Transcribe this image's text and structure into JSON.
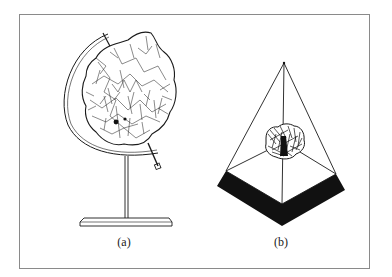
{
  "figure": {
    "panels": [
      {
        "id": "a",
        "caption": "(a)",
        "subject": "crumpled globe on a stand"
      },
      {
        "id": "b",
        "caption": "(b)",
        "subject": "crumpled object inside a wireframe pyramid with black base band"
      }
    ],
    "colors": {
      "frame": "#8a8a8a",
      "ink": "#1a1a1a",
      "background": "#ffffff"
    }
  }
}
